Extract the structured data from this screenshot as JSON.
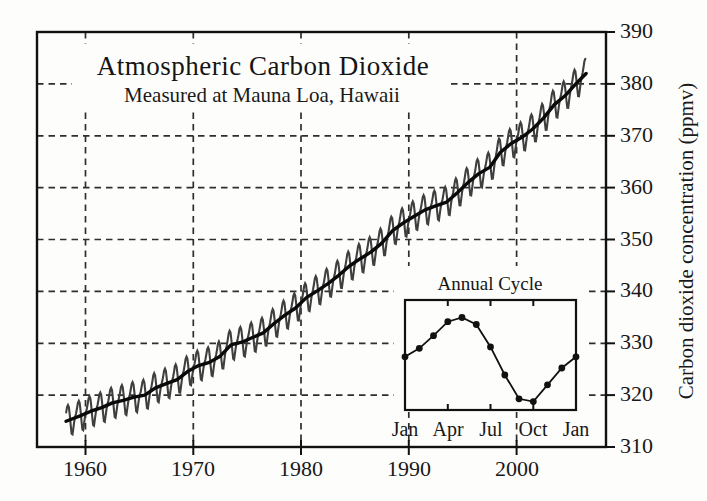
{
  "figure": {
    "title": "Atmospheric Carbon Dioxide",
    "subtitle": "Measured at Mauna Loa, Hawaii",
    "y_axis_label": "Carbon dioxide concentration (ppmv)"
  },
  "colors": {
    "ink": "#1c1c1c",
    "frame": "#111111",
    "gridline": "#2e2e2e",
    "trend_line": "#0a0a0a",
    "monthly_line": "#3f3f3f",
    "inset_line": "#111111",
    "background": "#fdfdfc"
  },
  "chart_data": [
    {
      "id": "main-co2-curve",
      "type": "line",
      "title": "Atmospheric Carbon Dioxide",
      "subtitle": "Measured at Mauna Loa, Hawaii",
      "xlabel": "",
      "ylabel": "Carbon dioxide concentration (ppmv)",
      "xlim": [
        1955.5,
        2008.3
      ],
      "ylim": [
        310,
        390
      ],
      "x_ticks": [
        1960,
        1970,
        1980,
        1990,
        2000
      ],
      "y_ticks": [
        310,
        320,
        330,
        340,
        350,
        360,
        370,
        380,
        390
      ],
      "grid": "dashed-both-axes",
      "legend": "none",
      "series": [
        {
          "name": "annual-mean-trend",
          "note": "smooth thick black line; values are annual means plotted at mid-year",
          "years": [
            1958,
            1959,
            1960,
            1961,
            1962,
            1963,
            1964,
            1965,
            1966,
            1967,
            1968,
            1969,
            1970,
            1971,
            1972,
            1973,
            1974,
            1975,
            1976,
            1977,
            1978,
            1979,
            1980,
            1981,
            1982,
            1983,
            1984,
            1985,
            1986,
            1987,
            1988,
            1989,
            1990,
            1991,
            1992,
            1993,
            1994,
            1995,
            1996,
            1997,
            1998,
            1999,
            2000,
            2001,
            2002,
            2003,
            2004,
            2005,
            2006
          ],
          "values": [
            315.2,
            316.0,
            316.9,
            317.6,
            318.5,
            319.0,
            319.6,
            320.0,
            321.4,
            322.2,
            323.0,
            324.6,
            325.7,
            326.3,
            327.5,
            329.7,
            330.2,
            331.1,
            332.0,
            333.8,
            335.4,
            336.8,
            338.8,
            340.1,
            341.5,
            343.1,
            344.9,
            346.3,
            347.6,
            349.3,
            351.7,
            353.2,
            354.5,
            355.7,
            356.5,
            357.2,
            359.0,
            361.0,
            362.7,
            363.9,
            366.8,
            368.5,
            369.7,
            371.3,
            373.4,
            376.0,
            377.7,
            380.0,
            382.1
          ]
        },
        {
          "name": "monthly-with-seasonal-cycle",
          "note": "thin dark oscillating line = annual-mean-trend interpolated monthly plus seasonal_anomaly_ppmv",
          "x_start": 1958.2,
          "x_end": 2006.45
        }
      ],
      "seasonal_anomaly_ppmv": [
        0.2,
        0.8,
        1.7,
        2.7,
        3.0,
        2.5,
        0.9,
        -1.1,
        -2.8,
        -3.0,
        -1.8,
        -0.6
      ]
    },
    {
      "id": "annual-cycle-inset",
      "type": "line",
      "title": "Annual Cycle",
      "x_tick_labels": [
        "Jan",
        "Apr",
        "Jul",
        "Oct",
        "Jan"
      ],
      "categories": [
        "Jan",
        "Feb",
        "Mar",
        "Apr",
        "May",
        "Jun",
        "Jul",
        "Aug",
        "Sep",
        "Oct",
        "Nov",
        "Dec",
        "Jan"
      ],
      "values": [
        0.2,
        0.8,
        1.7,
        2.7,
        3.0,
        2.5,
        0.9,
        -1.1,
        -2.8,
        -3.0,
        -1.8,
        -0.6,
        0.2
      ],
      "ylim": [
        -3.6,
        4.25
      ],
      "markers": "filled-circles",
      "units": "ppmv deviation from annual mean"
    }
  ]
}
